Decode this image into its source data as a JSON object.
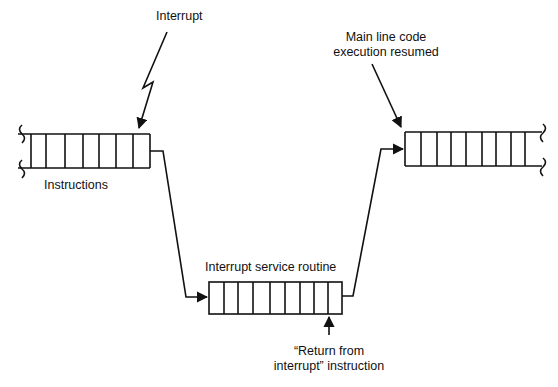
{
  "labels": {
    "interrupt": "Interrupt",
    "main_line_1": "Main line code",
    "main_line_2": "execution resumed",
    "instructions": "Instructions",
    "isr": "Interrupt service routine",
    "return_1": "“Return from",
    "return_2": "interrupt” instruction"
  },
  "colors": {
    "line": "#111111",
    "background": "#ffffff"
  }
}
